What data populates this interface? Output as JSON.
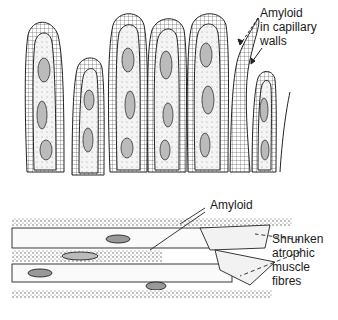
{
  "figure": {
    "top_panel": {
      "subject": "intestinal villi",
      "labels": [
        {
          "lines": [
            "Amyloid",
            "in capillary",
            "walls"
          ]
        }
      ]
    },
    "bottom_panel": {
      "subject": "muscle fibres",
      "labels": [
        {
          "lines": [
            "Amyloid"
          ]
        },
        {
          "lines": [
            "Shrunken",
            "atrophic",
            "muscle",
            "fibres"
          ]
        }
      ]
    }
  },
  "colors": {
    "ink": "#1a1a1a",
    "stipple": "#6b6b6b",
    "background": "#ffffff"
  }
}
